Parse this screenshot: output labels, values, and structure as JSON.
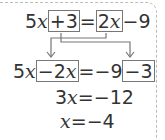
{
  "equation": {
    "line1": {
      "left_term": "5",
      "left_var": "x",
      "boxed_a": "+3",
      "equals": "=",
      "boxed_b_coef": "2",
      "boxed_b_var": "x",
      "tail": "−9"
    },
    "line2": {
      "left_term": "5",
      "left_var": "x",
      "boxed_a": "−2",
      "boxed_a_var": "x",
      "middle": "=−9",
      "boxed_b": "−3"
    },
    "line3": {
      "coef": "3",
      "var": "x",
      "rest": "=−12"
    },
    "line4": {
      "var": "x",
      "rest": "=−4"
    }
  },
  "colors": {
    "box": "#777777",
    "arrow": "#777777",
    "text": "#333333",
    "dashed_border": "#bbbbbb"
  }
}
